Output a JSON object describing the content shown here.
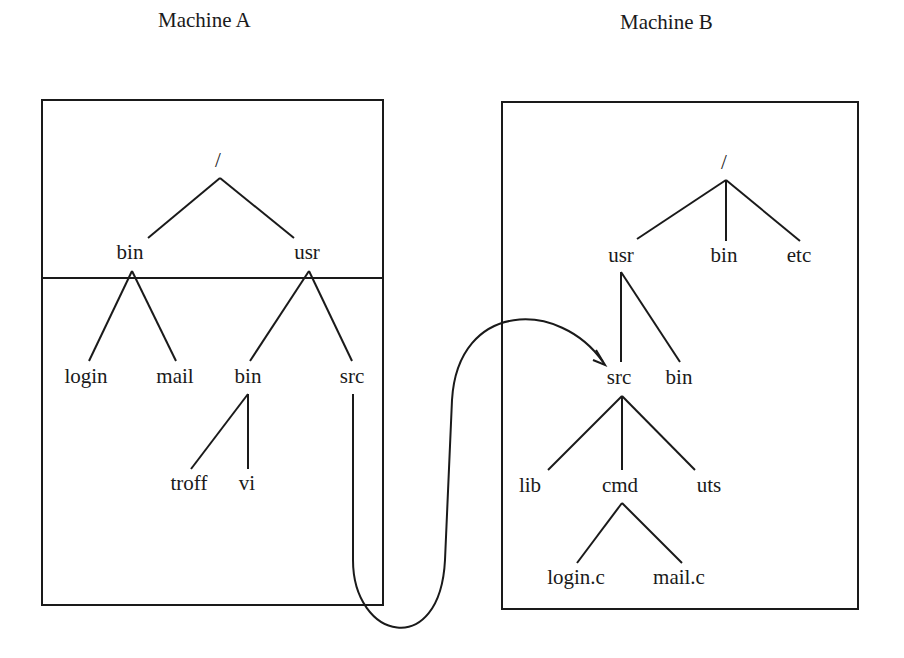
{
  "machine_a": {
    "title": "Machine A",
    "nodes": {
      "root": "/",
      "bin": "bin",
      "usr": "usr",
      "login": "login",
      "mail": "mail",
      "usr_bin": "bin",
      "src": "src",
      "troff": "troff",
      "vi": "vi"
    }
  },
  "machine_b": {
    "title": "Machine B",
    "nodes": {
      "root": "/",
      "usr": "usr",
      "bin": "bin",
      "etc": "etc",
      "src": "src",
      "usr_bin": "bin",
      "lib": "lib",
      "cmd": "cmd",
      "uts": "uts",
      "login_c": "login.c",
      "mail_c": "mail.c"
    }
  },
  "mount_link": {
    "from": "Machine A /usr/src",
    "to": "Machine B /usr/src"
  }
}
